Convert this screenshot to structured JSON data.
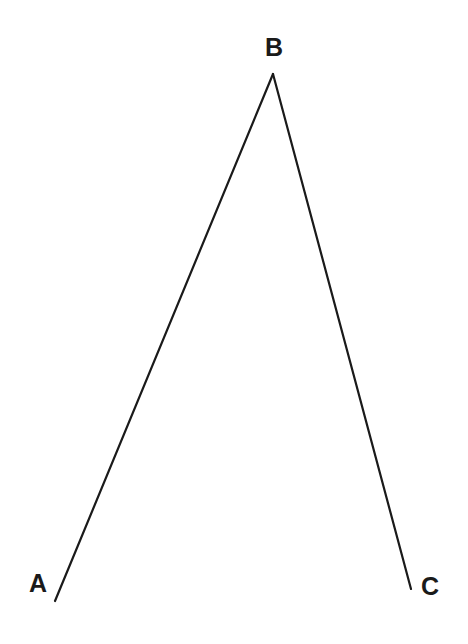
{
  "diagram": {
    "type": "angle",
    "name": "angle ABC",
    "points": [
      {
        "label": "A",
        "x": 55,
        "y": 601,
        "label_x": 38,
        "label_y": 592
      },
      {
        "label": "B",
        "x": 273,
        "y": 74,
        "label_x": 274,
        "label_y": 56
      },
      {
        "label": "C",
        "x": 411,
        "y": 589,
        "label_x": 430,
        "label_y": 595
      }
    ],
    "segments": [
      {
        "from": "B",
        "to": "A"
      },
      {
        "from": "B",
        "to": "C"
      }
    ],
    "colors": {
      "line": "#1a1a1a",
      "background": "#ffffff"
    }
  }
}
